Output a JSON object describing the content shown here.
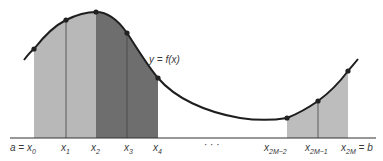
{
  "figure": {
    "curve_label": "y = f(x)",
    "ellipsis": "· · ·",
    "colors": {
      "background": "#ffffff",
      "curve": "#1e1e1e",
      "axis": "#333333",
      "panel_light": "#b8b8b8",
      "panel_dark": "#6e6e6e",
      "panel_right": "#bdbdbd",
      "point": "#222222",
      "text": "#3a3a3a"
    },
    "nodes": [
      {
        "label_main": "a = x",
        "sub": "0",
        "px": 34,
        "py": 49
      },
      {
        "label_main": "x",
        "sub": "1",
        "px": 66,
        "py": 20
      },
      {
        "label_main": "x",
        "sub": "2",
        "px": 96,
        "py": 12
      },
      {
        "label_main": "x",
        "sub": "3",
        "px": 127,
        "py": 33
      },
      {
        "label_main": "x",
        "sub": "4",
        "px": 158,
        "py": 78
      },
      {
        "label_main": "x",
        "sub": "2M−2",
        "px": 287,
        "py": 118
      },
      {
        "label_main": "x",
        "sub": "2M−1",
        "px": 318,
        "py": 101
      },
      {
        "label_main": "x",
        "sub": "2M",
        "suffix": " = b",
        "px": 348,
        "py": 71
      }
    ],
    "panels": [
      {
        "name": "panel-1",
        "from_node": 0,
        "to_node": 2,
        "shade": "light"
      },
      {
        "name": "panel-2",
        "from_node": 2,
        "to_node": 4,
        "shade": "dark"
      },
      {
        "name": "panel-M",
        "from_node": 5,
        "to_node": 7,
        "shade": "right"
      }
    ],
    "axis": {
      "x_start": 10,
      "x_end": 376,
      "y": 138
    }
  }
}
